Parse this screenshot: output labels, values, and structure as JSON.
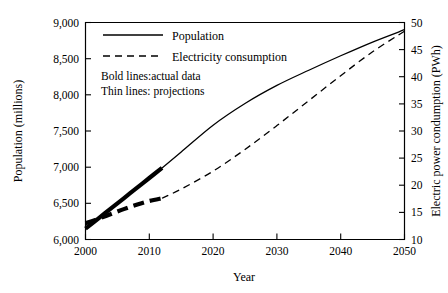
{
  "chart_data": {
    "type": "line",
    "title": "",
    "xlabel": "Year",
    "ylabel": "Population (millions)",
    "y2label": "Electric power condumption (PWh)",
    "xlim": [
      2000,
      2050
    ],
    "ylim": [
      6000,
      9000
    ],
    "y2lim": [
      10,
      50
    ],
    "grid": false,
    "legend_position": "top-center",
    "x_ticks": [
      "2000",
      "2010",
      "2020",
      "2030",
      "2040",
      "2050"
    ],
    "y_ticks": [
      "6,000",
      "6,500",
      "7,000",
      "7,500",
      "8,000",
      "8,500",
      "9,000"
    ],
    "y2_ticks": [
      "10",
      "15",
      "20",
      "25",
      "30",
      "35",
      "40",
      "45",
      "50"
    ],
    "annotations": [
      "Bold lines:actual data",
      "Thin lines: projections"
    ],
    "series": [
      {
        "name": "Population",
        "axis": "left",
        "style": "solid",
        "actual_x": [
          2000,
          2002,
          2004,
          2006,
          2008,
          2010,
          2012
        ],
        "actual_values": [
          6150,
          6290,
          6430,
          6570,
          6710,
          6850,
          6990
        ],
        "projection_x": [
          2012,
          2015,
          2020,
          2025,
          2030,
          2035,
          2040,
          2045,
          2050
        ],
        "projection_values": [
          6990,
          7210,
          7580,
          7880,
          8130,
          8340,
          8540,
          8730,
          8900
        ]
      },
      {
        "name": "Electricity consumption",
        "axis": "right",
        "style": "dashed",
        "actual_x": [
          2000,
          2002,
          2004,
          2006,
          2008,
          2010,
          2012
        ],
        "actual_values": [
          13.0,
          13.8,
          14.7,
          15.6,
          16.4,
          17.1,
          17.6
        ],
        "projection_x": [
          2012,
          2015,
          2020,
          2025,
          2030,
          2035,
          2040,
          2045,
          2050
        ],
        "projection_values": [
          17.6,
          19.3,
          22.6,
          26.6,
          31.0,
          35.6,
          40.2,
          44.6,
          48.4
        ]
      }
    ],
    "legend": [
      {
        "label": "Population",
        "style": "solid"
      },
      {
        "label": "Electricity consumption",
        "style": "dashed"
      }
    ]
  }
}
